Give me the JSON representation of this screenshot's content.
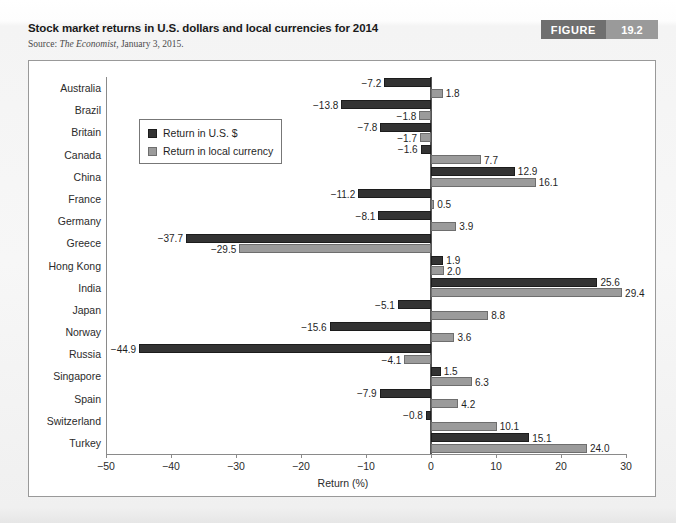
{
  "figure": {
    "title": "Stock market returns in U.S. dollars and local currencies for 2014",
    "source_label": "Source: ",
    "source_publication": "The Economist",
    "source_rest": ", January 3, 2015.",
    "badge_word": "FIGURE",
    "badge_number": "19.2"
  },
  "colors": {
    "usd_bar": "#333333",
    "local_bar": "#9b9b9b",
    "badge_word_bg": "#6f6f6f",
    "badge_num_bg": "#9a9a9a",
    "axis": "#8a8a8a"
  },
  "legend": {
    "items": [
      {
        "label": "Return in U.S. $",
        "series": "usd"
      },
      {
        "label": "Return in local currency",
        "series": "local"
      }
    ]
  },
  "chart_data": {
    "type": "bar",
    "orientation": "horizontal",
    "title": "Stock market returns in U.S. dollars and local currencies for 2014",
    "xlabel": "Return (%)",
    "ylabel": "",
    "xlim": [
      -50,
      30
    ],
    "xticks": [
      -50,
      -40,
      -30,
      -20,
      -10,
      0,
      10,
      20,
      30
    ],
    "xtick_labels": [
      "−50",
      "−40",
      "−30",
      "−20",
      "−10",
      "0",
      "10",
      "20",
      "30"
    ],
    "grid": false,
    "legend_position": "upper-left-inside",
    "categories": [
      "Australia",
      "Brazil",
      "Britain",
      "Canada",
      "China",
      "France",
      "Germany",
      "Greece",
      "Hong Kong",
      "India",
      "Japan",
      "Norway",
      "Russia",
      "Singapore",
      "Spain",
      "Switzerland",
      "Turkey"
    ],
    "series": [
      {
        "name": "Return in U.S. $",
        "color": "#333333",
        "values": [
          -7.2,
          -13.8,
          -7.8,
          -1.6,
          12.9,
          -11.2,
          -8.1,
          -37.7,
          1.9,
          25.6,
          -5.1,
          -15.6,
          -44.9,
          1.5,
          -7.9,
          -0.8,
          15.1
        ],
        "labels": [
          "−7.2",
          "−13.8",
          "−7.8",
          "−1.6",
          "12.9",
          "−11.2",
          "−8.1",
          "−37.7",
          "1.9",
          "25.6",
          "−5.1",
          "−15.6",
          "−44.9",
          "1.5",
          "−7.9",
          "−0.8",
          "15.1"
        ]
      },
      {
        "name": "Return in local currency",
        "color": "#9b9b9b",
        "values": [
          1.8,
          -1.8,
          -1.7,
          7.7,
          16.1,
          0.5,
          3.9,
          -29.5,
          2.0,
          29.4,
          8.8,
          3.6,
          -4.1,
          6.3,
          4.2,
          10.1,
          24.0
        ],
        "labels": [
          "1.8",
          "−1.8",
          "−1.7",
          "7.7",
          "16.1",
          "0.5",
          "3.9",
          "−29.5",
          "2.0",
          "29.4",
          "8.8",
          "3.6",
          "−4.1",
          "6.3",
          "4.2",
          "10.1",
          "24.0"
        ]
      }
    ]
  }
}
